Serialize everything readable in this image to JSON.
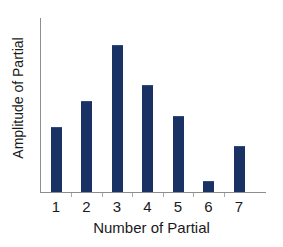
{
  "chart_data": {
    "type": "bar",
    "title": "",
    "subtitle": "",
    "xlabel": "Number of Partial",
    "ylabel": "Amplitude of Partial",
    "categories": [
      "1",
      "2",
      "3",
      "4",
      "5",
      "6",
      "7"
    ],
    "values": [
      0.37,
      0.52,
      0.84,
      0.61,
      0.43,
      0.06,
      0.26
    ],
    "series": [
      {
        "name": "Amplitude of Partial",
        "values": [
          0.37,
          0.52,
          0.84,
          0.61,
          0.43,
          0.06,
          0.26
        ]
      }
    ],
    "xlim": [
      0.5,
      7.8
    ],
    "ylim": [
      0,
      1
    ],
    "xticklabels": [
      "1",
      "2",
      "3",
      "4",
      "5",
      "6",
      "7"
    ],
    "yticklabels": [],
    "grid": false,
    "legend": null,
    "legend_position": "none",
    "annotations": [],
    "colors": {
      "bar": "#1a3263",
      "bar_highlight": "#2e4b86",
      "axis": "#8e8e8e",
      "tick": "#a8a8a8",
      "text": "#1a1a1a",
      "background": "#ffffff"
    }
  },
  "axes": {
    "x_axis_name": "x-axis",
    "y_axis_name": "y-axis"
  }
}
